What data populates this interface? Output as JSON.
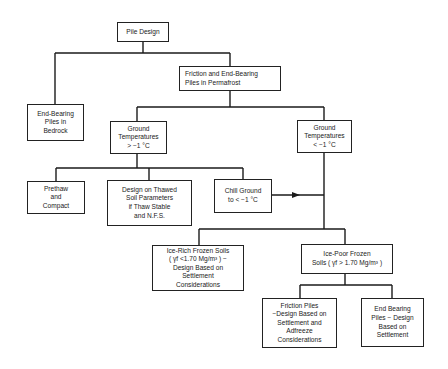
{
  "diagram": {
    "type": "flowchart",
    "title": "Pile Design",
    "nodes": [
      {
        "id": "pile_design",
        "label": "Pile Design"
      },
      {
        "id": "friction_end_bearing_permafrost",
        "label": "Friction and End-Bearing\nPiles in Permafrost"
      },
      {
        "id": "end_bearing_bedrock",
        "label": "End-Bearing\nPiles in\nBedrock"
      },
      {
        "id": "ground_temp_warm",
        "label": "Ground\nTemperatures\n> −1 °C"
      },
      {
        "id": "ground_temp_cold",
        "label": "Ground\nTemperatures\n< −1 °C"
      },
      {
        "id": "prethaw",
        "label": "Prethaw\nand\nCompact"
      },
      {
        "id": "design_thawed",
        "label": "Design on Thawed\nSoil Parameters\nif Thaw Stable\nand N.F.S."
      },
      {
        "id": "chill_ground",
        "label": "Chill Ground\nto < −1 °C"
      },
      {
        "id": "ice_rich",
        "label": "Ice-Rich Frozen Soils\n( γf <1.70 Mg/m³ ) −\nDesign Based on\nSettlement\nConsiderations"
      },
      {
        "id": "ice_poor",
        "label": "Ice-Poor Frozen\nSoils ( γf > 1.70 Mg/m³ )"
      },
      {
        "id": "friction_piles",
        "label": "Friction Piles\n−Design Based on\nSettlement and\nAdfreeze\nConsiderations"
      },
      {
        "id": "end_bearing_settlement",
        "label": "End Bearing\nPiles − Design\nBased on\nSettlement"
      }
    ],
    "edges": [
      {
        "from": "pile_design",
        "to": "end_bearing_bedrock"
      },
      {
        "from": "pile_design",
        "to": "friction_end_bearing_permafrost"
      },
      {
        "from": "friction_end_bearing_permafrost",
        "to": "ground_temp_warm"
      },
      {
        "from": "friction_end_bearing_permafrost",
        "to": "ground_temp_cold"
      },
      {
        "from": "ground_temp_warm",
        "to": "prethaw"
      },
      {
        "from": "ground_temp_warm",
        "to": "design_thawed"
      },
      {
        "from": "ground_temp_warm",
        "to": "chill_ground"
      },
      {
        "from": "chill_ground",
        "to": "ground_temp_cold",
        "arrow": true
      },
      {
        "from": "ground_temp_cold",
        "to": "ice_rich"
      },
      {
        "from": "ground_temp_cold",
        "to": "ice_poor"
      },
      {
        "from": "ice_poor",
        "to": "friction_piles"
      },
      {
        "from": "ice_poor",
        "to": "end_bearing_settlement"
      }
    ]
  }
}
